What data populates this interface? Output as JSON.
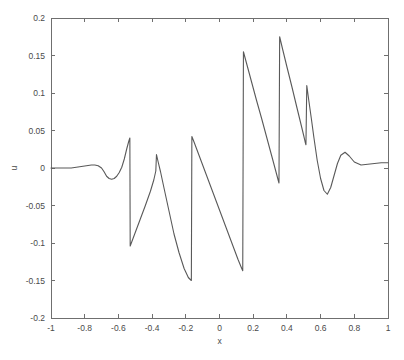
{
  "figure": {
    "background_color": "#ffffff",
    "axis_color": "#6f6f6f",
    "line_color": "#595959",
    "width": 404,
    "height": 360
  },
  "plot_box": {
    "left": 51,
    "right": 388,
    "top": 18,
    "bottom": 318
  },
  "axes": {
    "x_title": "x",
    "y_title": "u",
    "x_tick_labels": [
      "-1",
      "-0.8",
      "-0.6",
      "-0.4",
      "-0.2",
      "0",
      "0.2",
      "0.4",
      "0.6",
      "0.8",
      "1"
    ],
    "x_tick_values": [
      -1,
      -0.8,
      -0.6,
      -0.4,
      -0.2,
      0,
      0.2,
      0.4,
      0.6,
      0.8,
      1
    ],
    "y_tick_labels": [
      "0.2",
      "0.15",
      "0.1",
      "0.05",
      "0",
      "-0.05",
      "-0.1",
      "-0.15",
      "-0.2"
    ],
    "y_tick_values": [
      0.2,
      0.15,
      0.1,
      0.05,
      0,
      -0.05,
      -0.1,
      -0.15,
      -0.2
    ]
  },
  "chart_data": {
    "type": "line",
    "title": "",
    "subtitle": "",
    "xlabel": "x",
    "ylabel": "u",
    "xlim": [
      -1,
      1
    ],
    "ylim": [
      -0.2,
      0.2
    ],
    "grid": false,
    "legend": null,
    "annotations": [],
    "series": [
      {
        "name": "u(x)",
        "color": "#595959",
        "x": [
          -1.0,
          -0.96,
          -0.92,
          -0.88,
          -0.85,
          -0.82,
          -0.79,
          -0.76,
          -0.74,
          -0.72,
          -0.7,
          -0.685,
          -0.67,
          -0.655,
          -0.64,
          -0.625,
          -0.61,
          -0.595,
          -0.58,
          -0.565,
          -0.55,
          -0.538,
          -0.532,
          -0.53,
          -0.52,
          -0.5,
          -0.47,
          -0.44,
          -0.41,
          -0.39,
          -0.378,
          -0.374,
          -0.365,
          -0.35,
          -0.33,
          -0.3,
          -0.27,
          -0.24,
          -0.21,
          -0.185,
          -0.172,
          -0.167,
          -0.164,
          -0.15,
          -0.12,
          -0.08,
          -0.04,
          0.0,
          0.04,
          0.08,
          0.11,
          0.132,
          0.138,
          0.142,
          0.16,
          0.19,
          0.22,
          0.25,
          0.28,
          0.31,
          0.335,
          0.348,
          0.353,
          0.357,
          0.375,
          0.4,
          0.43,
          0.46,
          0.485,
          0.5,
          0.508,
          0.513,
          0.518,
          0.53,
          0.545,
          0.56,
          0.58,
          0.6,
          0.62,
          0.64,
          0.66,
          0.68,
          0.7,
          0.72,
          0.745,
          0.77,
          0.8,
          0.84,
          0.88,
          0.92,
          0.96,
          1.0
        ],
        "y": [
          0.0,
          0.0,
          0.0,
          0.0,
          0.001,
          0.002,
          0.003,
          0.004,
          0.004,
          0.003,
          0.0,
          -0.005,
          -0.011,
          -0.014,
          -0.015,
          -0.014,
          -0.011,
          -0.006,
          0.001,
          0.012,
          0.026,
          0.036,
          0.04,
          -0.104,
          -0.098,
          -0.086,
          -0.068,
          -0.05,
          -0.031,
          -0.016,
          -0.004,
          0.018,
          0.009,
          -0.005,
          -0.026,
          -0.057,
          -0.088,
          -0.113,
          -0.134,
          -0.146,
          -0.149,
          -0.15,
          0.042,
          0.034,
          0.016,
          -0.008,
          -0.032,
          -0.056,
          -0.08,
          -0.104,
          -0.122,
          -0.134,
          -0.137,
          0.155,
          0.14,
          0.115,
          0.09,
          0.066,
          0.041,
          0.016,
          -0.005,
          -0.016,
          -0.02,
          0.175,
          0.158,
          0.135,
          0.108,
          0.08,
          0.057,
          0.043,
          0.035,
          0.031,
          0.11,
          0.09,
          0.066,
          0.041,
          0.01,
          -0.014,
          -0.03,
          -0.035,
          -0.026,
          -0.01,
          0.006,
          0.017,
          0.021,
          0.016,
          0.008,
          0.004,
          0.005,
          0.006,
          0.007,
          0.007
        ]
      }
    ]
  }
}
